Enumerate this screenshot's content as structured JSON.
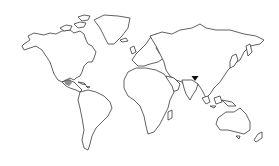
{
  "map": {
    "type": "world-outline",
    "background": "#ffffff",
    "outline_color": "#3a3a3a",
    "markers": [
      {
        "name": "india-marker",
        "shape": "triangle-down",
        "color": "#111111",
        "x": 195,
        "y": 78
      },
      {
        "name": "central-america-highlight",
        "shape": "hatched-area",
        "color": "#6a6a6a",
        "x": 68,
        "y": 82
      }
    ]
  }
}
